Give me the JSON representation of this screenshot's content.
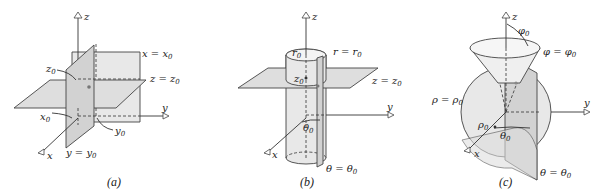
{
  "figure": {
    "panels": [
      {
        "id": "a",
        "caption": "(a)",
        "title": "Rectangular coordinate surfaces",
        "axes": {
          "x": "x",
          "y": "y",
          "z": "z"
        },
        "labels": {
          "plane_x": "x = x",
          "plane_x_sub": "0",
          "plane_y": "y = y",
          "plane_y_sub": "0",
          "plane_z": "z = z",
          "plane_z_sub": "0",
          "x0": "x",
          "x0_sub": "0",
          "y0": "y",
          "y0_sub": "0",
          "z0": "z",
          "z0_sub": "0"
        }
      },
      {
        "id": "b",
        "caption": "(b)",
        "title": "Cylindrical coordinate surfaces",
        "axes": {
          "x": "x",
          "y": "y",
          "z": "z"
        },
        "labels": {
          "surface_r": "r = r",
          "surface_r_sub": "0",
          "plane_z": "z = z",
          "plane_z_sub": "0",
          "half_plane_theta": "θ = θ",
          "half_plane_theta_sub": "0",
          "r0": "r",
          "r0_sub": "0",
          "z0": "z",
          "z0_sub": "0",
          "theta0": "θ",
          "theta0_sub": "0"
        }
      },
      {
        "id": "c",
        "caption": "(c)",
        "title": "Spherical coordinate surfaces",
        "axes": {
          "x": "x",
          "y": "y",
          "z": "z"
        },
        "labels": {
          "sphere_rho": "ρ = ρ",
          "sphere_rho_sub": "0",
          "cone_phi": "φ = φ",
          "cone_phi_sub": "0",
          "half_plane_theta": "θ = θ",
          "half_plane_theta_sub": "0",
          "phi0": "φ",
          "phi0_sub": "0",
          "rho0": "ρ",
          "rho0_sub": "0",
          "theta0": "θ",
          "theta0_sub": "0"
        }
      }
    ]
  }
}
